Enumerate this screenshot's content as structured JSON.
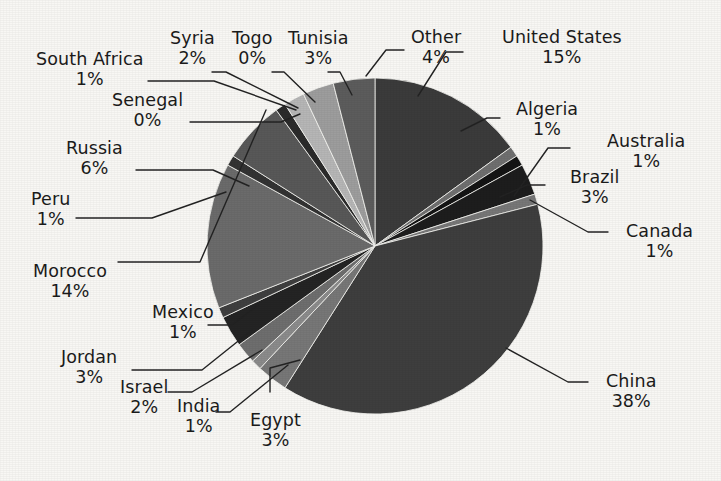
{
  "chart_data": {
    "type": "pie",
    "title": "",
    "subtitle": "",
    "xlabel": "",
    "ylabel": "",
    "legend_position": "none",
    "grid": false,
    "labels_show_percent": true,
    "start_angle_deg": 0,
    "direction": "clockwise",
    "categories": [
      "United States",
      "Algeria",
      "Australia",
      "Brazil",
      "Canada",
      "China",
      "Egypt",
      "India",
      "Israel",
      "Jordan",
      "Mexico",
      "Morocco",
      "Peru",
      "Russia",
      "Senegal",
      "South Africa",
      "Syria",
      "Togo",
      "Tunisia",
      "Other"
    ],
    "values": [
      15,
      1,
      1,
      3,
      1,
      38,
      3,
      1,
      2,
      3,
      1,
      14,
      1,
      6,
      0,
      1,
      2,
      0,
      3,
      4
    ],
    "value_labels": [
      "15%",
      "1%",
      "1%",
      "3%",
      "1%",
      "38%",
      "3%",
      "1%",
      "2%",
      "3%",
      "1%",
      "14%",
      "1%",
      "6%",
      "0%",
      "1%",
      "2%",
      "0%",
      "3%",
      "4%"
    ],
    "colors": [
      "#3b3b3b",
      "#6f6f6f",
      "#141414",
      "#1d1d1d",
      "#777777",
      "#3e3e3e",
      "#777777",
      "#8b8b8b",
      "#6e6e6e",
      "#242424",
      "#3f3f3f",
      "#6b6b6b",
      "#333333",
      "#585858",
      "#d8d8d8",
      "#2b2b2b",
      "#b6b6b6",
      "#7d7d7d",
      "#9d9d9d",
      "#5c5c5c"
    ]
  },
  "geometry": {
    "center_x": 375,
    "center_y": 246,
    "radius": 168
  },
  "style": {
    "background": "#f8f7f4",
    "text_color": "#1b1b1b",
    "leader_color": "#232323"
  },
  "labels": [
    {
      "name": "South Africa",
      "pct": "1%",
      "x": 36,
      "y": 50,
      "align": "ta-center"
    },
    {
      "name": "Syria",
      "pct": "2%",
      "x": 170,
      "y": 29,
      "align": "ta-center"
    },
    {
      "name": "Togo",
      "pct": "0%",
      "x": 232,
      "y": 29,
      "align": "ta-center"
    },
    {
      "name": "Tunisia",
      "pct": "3%",
      "x": 288,
      "y": 29,
      "align": "ta-center"
    },
    {
      "name": "Other",
      "pct": "4%",
      "x": 411,
      "y": 28,
      "align": "ta-center"
    },
    {
      "name": "United States",
      "pct": "15%",
      "x": 502,
      "y": 28,
      "align": "ta-center"
    },
    {
      "name": "Senegal",
      "pct": "0%",
      "x": 112,
      "y": 91,
      "align": "ta-center"
    },
    {
      "name": "Algeria",
      "pct": "1%",
      "x": 516,
      "y": 100,
      "align": "ta-center"
    },
    {
      "name": "Australia",
      "pct": "1%",
      "x": 607,
      "y": 132,
      "align": "ta-center"
    },
    {
      "name": "Russia",
      "pct": "6%",
      "x": 66,
      "y": 139,
      "align": "ta-center"
    },
    {
      "name": "Brazil",
      "pct": "3%",
      "x": 570,
      "y": 168,
      "align": "ta-center"
    },
    {
      "name": "Peru",
      "pct": "1%",
      "x": 31,
      "y": 190,
      "align": "ta-center"
    },
    {
      "name": "Canada",
      "pct": "1%",
      "x": 626,
      "y": 222,
      "align": "ta-center"
    },
    {
      "name": "Morocco",
      "pct": "14%",
      "x": 33,
      "y": 262,
      "align": "ta-center"
    },
    {
      "name": "Mexico",
      "pct": "1%",
      "x": 152,
      "y": 303,
      "align": "ta-center"
    },
    {
      "name": "Jordan",
      "pct": "3%",
      "x": 61,
      "y": 348,
      "align": "ta-center"
    },
    {
      "name": "Israel",
      "pct": "2%",
      "x": 120,
      "y": 378,
      "align": "ta-center"
    },
    {
      "name": "China",
      "pct": "38%",
      "x": 606,
      "y": 372,
      "align": "ta-center"
    },
    {
      "name": "India",
      "pct": "1%",
      "x": 177,
      "y": 397,
      "align": "ta-center"
    },
    {
      "name": "Egypt",
      "pct": "3%",
      "x": 250,
      "y": 411,
      "align": "ta-center"
    }
  ],
  "leaders": [
    {
      "name": "south-africa-leader",
      "points": "148,81 214,81 296,110"
    },
    {
      "name": "syria-leader",
      "points": "212,72 226,72 298,108"
    },
    {
      "name": "togo-leader",
      "points": "272,72 284,72 315,102"
    },
    {
      "name": "tunisia-leader",
      "points": "328,72 340,72 352,95"
    },
    {
      "name": "senegal-leader",
      "points": "190,122 281,122 300,114"
    },
    {
      "name": "russia-leader",
      "points": "136,170 213,170 249,186"
    },
    {
      "name": "peru-leader",
      "points": "76,218 152,218 226,192"
    },
    {
      "name": "morocco-leader",
      "points": "118,262 200,262 266,110"
    },
    {
      "name": "mexico-leader",
      "points": "208,325 232,325 258,305"
    },
    {
      "name": "jordan-leader",
      "points": "132,370 202,370 252,330"
    },
    {
      "name": "israel-leader",
      "points": "168,392 192,392 262,350"
    },
    {
      "name": "india-leader",
      "points": "216,412 230,412 288,365"
    },
    {
      "name": "egypt-leader",
      "points": "270,392 270,368 300,360"
    },
    {
      "name": "other-leader",
      "points": "404,50 386,50 366,76"
    },
    {
      "name": "united-states-leader",
      "points": "463,52 446,52 418,96"
    },
    {
      "name": "algeria-leader",
      "points": "500,118 487,118 461,131"
    },
    {
      "name": "australia-leader",
      "points": "570,148 548,148 514,196"
    },
    {
      "name": "brazil-leader",
      "points": "545,185 527,185 500,197"
    },
    {
      "name": "canada-leader",
      "points": "608,232 588,232 530,200"
    },
    {
      "name": "china-leader",
      "points": "588,382 568,382 506,348"
    }
  ]
}
